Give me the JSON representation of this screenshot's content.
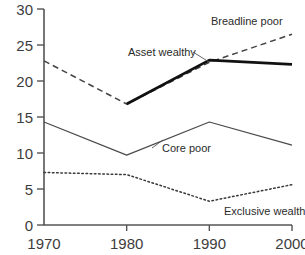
{
  "chart_data": {
    "type": "line",
    "title": "",
    "subtitle": "",
    "xlabel": "",
    "ylabel": "",
    "x": [
      1970,
      1980,
      1990,
      2000
    ],
    "xtick_labels": [
      "1970",
      "1980",
      "1990",
      "2000"
    ],
    "ytick_labels": [
      "0",
      "5",
      "10",
      "15",
      "20",
      "25",
      "30"
    ],
    "ytick_values": [
      0,
      5,
      10,
      15,
      20,
      25,
      30
    ],
    "xlim": [
      1970,
      2000
    ],
    "ylim": [
      0,
      30
    ],
    "grid": false,
    "legend_position": "inline-annotations",
    "series": [
      {
        "name": "Breadline poor",
        "style": "dashed",
        "color": "#444444",
        "x": [
          1970,
          1980,
          1990,
          2000
        ],
        "values": [
          22.8,
          16.8,
          22.6,
          26.5
        ]
      },
      {
        "name": "Asset wealthy",
        "style": "solid-thick",
        "color": "#111111",
        "x": [
          1980,
          1990,
          2000
        ],
        "values": [
          16.8,
          22.9,
          22.3
        ]
      },
      {
        "name": "Core poor",
        "style": "solid-thin",
        "color": "#4a4a4a",
        "x": [
          1970,
          1980,
          1990,
          2000
        ],
        "values": [
          14.3,
          9.7,
          14.3,
          11.1
        ]
      },
      {
        "name": "Exclusive wealthy",
        "style": "dotted",
        "color": "#3a3a3a",
        "x": [
          1970,
          1980,
          1990,
          2000
        ],
        "values": [
          7.3,
          7.0,
          3.3,
          5.6
        ]
      }
    ],
    "annotations": [
      {
        "text": "Breadline poor",
        "x_px": 211,
        "y_px": 25
      },
      {
        "text": "Asset wealthy",
        "x_px": 128,
        "y_px": 56
      },
      {
        "text": "Core poor",
        "x_px": 162,
        "y_px": 152
      },
      {
        "text": "Exclusive wealthy",
        "x_px": 224,
        "y_px": 215
      }
    ],
    "annotation_leaders": [
      {
        "for": "Asset wealthy",
        "x1_px": 193,
        "y1_px": 52,
        "x2_px": 209,
        "y2_px": 62
      },
      {
        "for": "Core poor",
        "x1_px": 152,
        "y1_px": 148,
        "x2_px": 163,
        "y2_px": 140
      }
    ]
  }
}
